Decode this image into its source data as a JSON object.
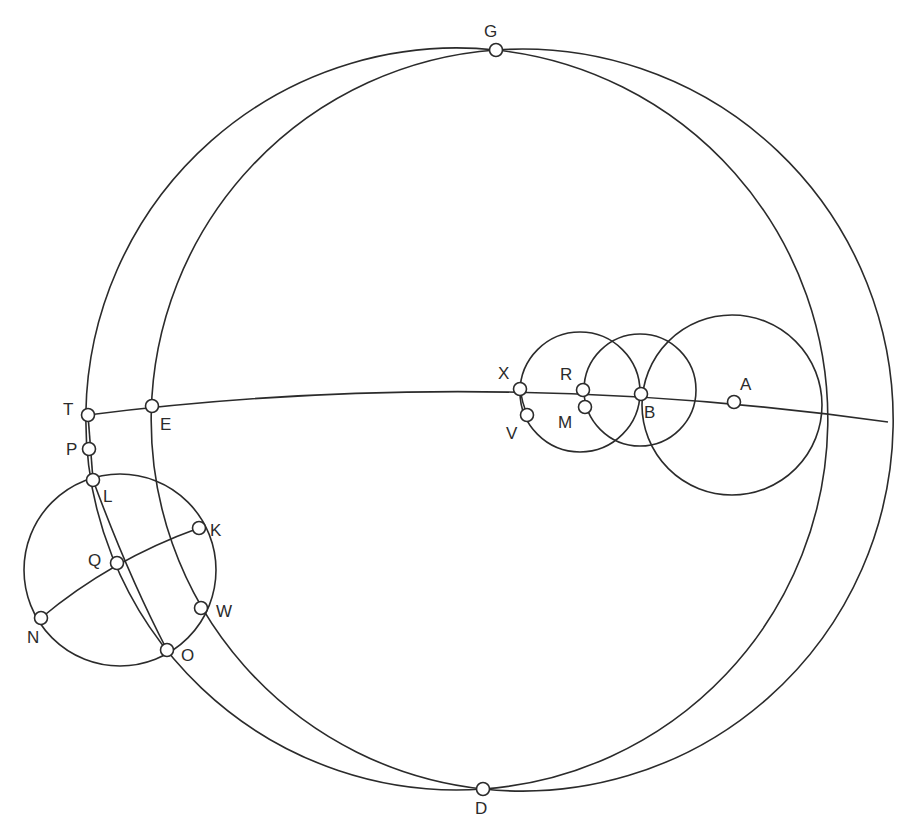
{
  "figure": {
    "stroke_color": "#2b2b2b",
    "background": "#ffffff"
  },
  "points": [
    {
      "id": "G",
      "label": "G",
      "x": 496,
      "y": 50,
      "lx": 484,
      "ly": 37
    },
    {
      "id": "D",
      "label": "D",
      "x": 483,
      "y": 789,
      "lx": 475,
      "ly": 814
    },
    {
      "id": "T",
      "label": "T",
      "x": 88,
      "y": 415,
      "lx": 63,
      "ly": 415
    },
    {
      "id": "E",
      "label": "E",
      "x": 152,
      "y": 406,
      "lx": 160,
      "ly": 430
    },
    {
      "id": "P",
      "label": "P",
      "x": 89,
      "y": 449,
      "lx": 66,
      "ly": 455
    },
    {
      "id": "L",
      "label": "L",
      "x": 93,
      "y": 480,
      "lx": 103,
      "ly": 502
    },
    {
      "id": "K",
      "label": "K",
      "x": 199,
      "y": 528,
      "lx": 210,
      "ly": 536
    },
    {
      "id": "Q",
      "label": "Q",
      "x": 117,
      "y": 563,
      "lx": 88,
      "ly": 566
    },
    {
      "id": "W",
      "label": "W",
      "x": 201,
      "y": 608,
      "lx": 216,
      "ly": 617
    },
    {
      "id": "N",
      "label": "N",
      "x": 41,
      "y": 618,
      "lx": 27,
      "ly": 643
    },
    {
      "id": "O",
      "label": "O",
      "x": 167,
      "y": 650,
      "lx": 181,
      "ly": 661
    },
    {
      "id": "X",
      "label": "X",
      "x": 520,
      "y": 389,
      "lx": 498,
      "ly": 379
    },
    {
      "id": "V",
      "label": "V",
      "x": 527,
      "y": 415,
      "lx": 506,
      "ly": 439
    },
    {
      "id": "R",
      "label": "R",
      "x": 583,
      "y": 390,
      "lx": 560,
      "ly": 380
    },
    {
      "id": "M",
      "label": "M",
      "x": 585,
      "y": 407,
      "lx": 558,
      "ly": 428
    },
    {
      "id": "B",
      "label": "B",
      "x": 641,
      "y": 394,
      "lx": 644,
      "ly": 418
    },
    {
      "id": "A",
      "label": "A",
      "x": 734,
      "y": 402,
      "lx": 740,
      "ly": 390
    }
  ],
  "curves": {
    "outer_left": "M496,50 A371,371 0 1,0 483,789",
    "outer_right": "M496,50 A371,371 0 1,1 483,789",
    "inner_left": "M496,50 A371,371 0 0,0 483,789",
    "inner_right": "M496,50 A371,371 0 0,1 483,789",
    "equator": "M88,415 Q480,365 888,422",
    "circle_X": {
      "cx": 580,
      "cy": 392,
      "r": 60
    },
    "circle_B": {
      "cx": 640,
      "cy": 390,
      "r": 56
    },
    "circle_A": {
      "cx": 732,
      "cy": 405,
      "r": 90
    },
    "circle_left": {
      "cx": 120,
      "cy": 570,
      "r": 96
    },
    "arc_TL": "M88,415 L93,480",
    "arc_LO": "M93,480 Q128,575 167,650",
    "arc_NK": "M41,618 Q110,560 199,528",
    "arc_XV": "M520,389 Q522,402 527,415"
  }
}
